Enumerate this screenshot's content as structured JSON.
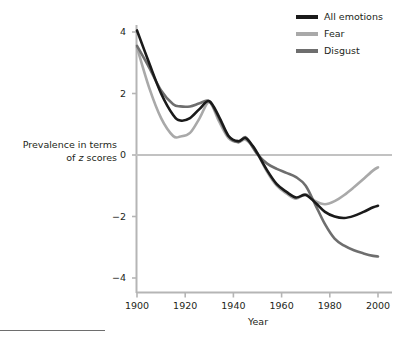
{
  "chart_data": {
    "type": "line",
    "title": "",
    "subtitle": "",
    "xlabel": "Year",
    "ylabel": "Prevalence in terms of z scores",
    "ylabel_line1": "Prevalence in terms",
    "ylabel_line2_pre": "of ",
    "ylabel_line2_italic": "z",
    "ylabel_line2_post": " scores",
    "xlim": [
      1895,
      2003
    ],
    "ylim": [
      -4.6,
      4.6
    ],
    "xticks": [
      1900,
      1920,
      1940,
      1960,
      1980,
      2000
    ],
    "xtick_labels": [
      "1900",
      "1920",
      "1940",
      "1960",
      "1980",
      "2000"
    ],
    "yticks": [
      4,
      2,
      0,
      -2,
      -4
    ],
    "ytick_labels": [
      "4",
      "2",
      "0",
      "−2",
      "−4"
    ],
    "grid": false,
    "zero_line": true,
    "legend_position": "top-right",
    "colors": {
      "all_emotions": "#1a1a1a",
      "fear": "#a9a9a9",
      "disgust": "#6e6e6e",
      "axis": "#b5b5b5",
      "zero_line": "#c2c2c2",
      "text": "#231f20"
    },
    "series": [
      {
        "name": "All emotions",
        "color": "#1a1a1a",
        "x": [
          1900,
          1905,
          1910,
          1915,
          1918,
          1922,
          1926,
          1930,
          1934,
          1938,
          1942,
          1945,
          1948,
          1950,
          1954,
          1958,
          1962,
          1966,
          1970,
          1974,
          1978,
          1982,
          1986,
          1990,
          1994,
          1998,
          2000
        ],
        "values": [
          4.05,
          3.0,
          2.0,
          1.3,
          1.12,
          1.2,
          1.5,
          1.75,
          1.25,
          0.62,
          0.45,
          0.55,
          0.3,
          0.05,
          -0.5,
          -0.95,
          -1.2,
          -1.38,
          -1.3,
          -1.55,
          -1.85,
          -2.0,
          -2.05,
          -1.98,
          -1.85,
          -1.7,
          -1.65
        ]
      },
      {
        "name": "Fear",
        "color": "#a9a9a9",
        "x": [
          1900,
          1905,
          1910,
          1915,
          1918,
          1922,
          1926,
          1930,
          1934,
          1938,
          1942,
          1945,
          1948,
          1950,
          1954,
          1958,
          1962,
          1966,
          1970,
          1974,
          1978,
          1982,
          1986,
          1990,
          1994,
          1998,
          2000
        ],
        "values": [
          3.5,
          2.2,
          1.2,
          0.62,
          0.6,
          0.72,
          1.2,
          1.72,
          1.1,
          0.55,
          0.42,
          0.5,
          0.28,
          0.05,
          -0.55,
          -1.0,
          -1.25,
          -1.42,
          -1.28,
          -1.5,
          -1.6,
          -1.5,
          -1.3,
          -1.05,
          -0.78,
          -0.5,
          -0.4
        ]
      },
      {
        "name": "Disgust",
        "color": "#6e6e6e",
        "x": [
          1900,
          1905,
          1910,
          1915,
          1918,
          1922,
          1926,
          1930,
          1934,
          1938,
          1942,
          1945,
          1948,
          1950,
          1954,
          1958,
          1962,
          1966,
          1970,
          1974,
          1978,
          1982,
          1986,
          1990,
          1994,
          1998,
          2000
        ],
        "values": [
          3.55,
          2.85,
          2.1,
          1.65,
          1.58,
          1.58,
          1.68,
          1.75,
          1.2,
          0.6,
          0.42,
          0.58,
          0.25,
          0.02,
          -0.28,
          -0.45,
          -0.58,
          -0.72,
          -1.0,
          -1.62,
          -2.25,
          -2.72,
          -2.95,
          -3.1,
          -3.2,
          -3.28,
          -3.3
        ]
      }
    ]
  },
  "legend": {
    "items": [
      {
        "label": "All emotions",
        "color": "#1a1a1a"
      },
      {
        "label": "Fear",
        "color": "#a9a9a9"
      },
      {
        "label": "Disgust",
        "color": "#6e6e6e"
      }
    ]
  }
}
